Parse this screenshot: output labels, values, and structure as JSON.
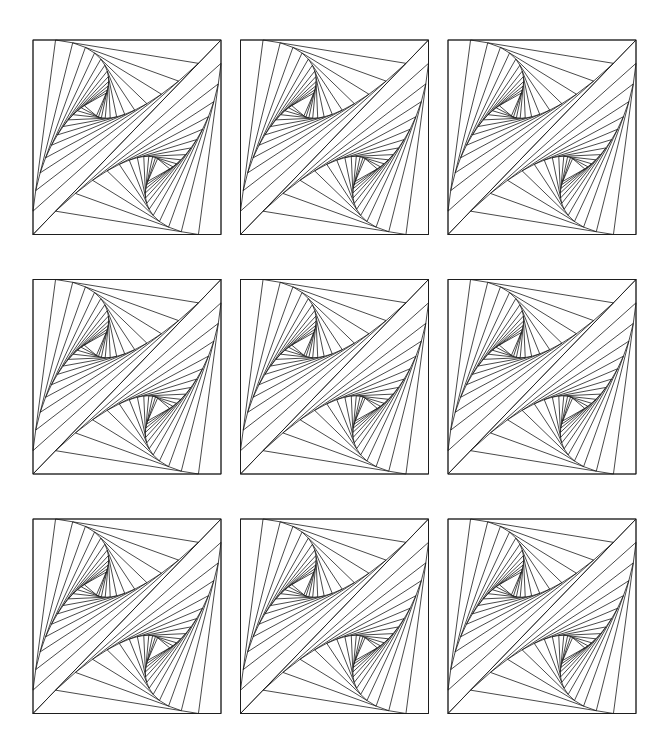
{
  "pattern": {
    "name": "spiral-whirl-tiles",
    "rows": 3,
    "cols": 3,
    "tile_count": 9,
    "colors": {
      "background": "#ffffff",
      "stroke": "#1a1a1a"
    },
    "tiles": [
      {
        "row": 1,
        "col": 1
      },
      {
        "row": 1,
        "col": 2
      },
      {
        "row": 1,
        "col": 3
      },
      {
        "row": 2,
        "col": 1
      },
      {
        "row": 2,
        "col": 2
      },
      {
        "row": 2,
        "col": 3
      },
      {
        "row": 3,
        "col": 1
      },
      {
        "row": 3,
        "col": 2
      },
      {
        "row": 3,
        "col": 3
      }
    ]
  }
}
